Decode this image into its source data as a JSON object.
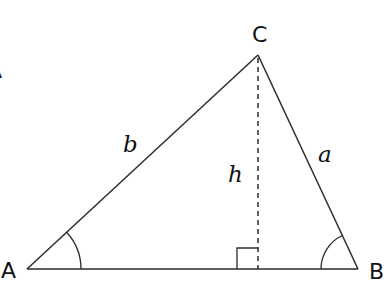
{
  "diagram": {
    "colors": {
      "line": "#2b2b2b",
      "text": "#111111",
      "background": "#ffffff"
    },
    "vertices": [
      {
        "id": "A",
        "label": "A",
        "x": 27,
        "y": 269
      },
      {
        "id": "B",
        "label": "B",
        "x": 358,
        "y": 269
      },
      {
        "id": "C",
        "label": "C",
        "x": 258,
        "y": 55
      }
    ],
    "sides": [
      {
        "id": "a",
        "label": "a",
        "from": "B",
        "to": "C"
      },
      {
        "id": "b",
        "label": "b",
        "from": "A",
        "to": "C"
      },
      {
        "id": "c",
        "label": "",
        "from": "A",
        "to": "B"
      }
    ],
    "altitude": {
      "label": "h",
      "from": "C",
      "foot_x": 258,
      "foot_y": 269,
      "style": "dashed",
      "right_angle_marker": true
    },
    "angle_marks": [
      {
        "vertex": "A",
        "type": "arc"
      },
      {
        "vertex": "B",
        "type": "arc"
      }
    ],
    "edge_fragment_label": "A"
  }
}
